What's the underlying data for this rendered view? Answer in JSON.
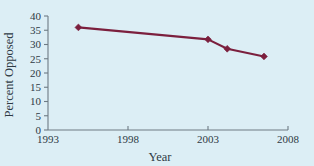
{
  "chart_data": {
    "type": "line",
    "title": "",
    "xlabel": "Year",
    "ylabel": "Percent Opposed",
    "xlim": [
      1993,
      2008
    ],
    "ylim": [
      0,
      40
    ],
    "grid": false,
    "legend": false,
    "xticks": [
      1993,
      1998,
      2003,
      2008
    ],
    "xtick_labels": [
      "1993",
      "1998",
      "2003",
      "2008"
    ],
    "yticks": [
      0,
      5,
      10,
      15,
      20,
      25,
      30,
      35,
      40
    ],
    "ytick_labels": [
      "0",
      "5",
      "10",
      "15",
      "20",
      "25",
      "30",
      "35",
      "40"
    ],
    "series": [
      {
        "name": "Percent Opposed",
        "color": "#7b1f3d",
        "marker": "diamond",
        "x": [
          1994.9,
          2003.0,
          2004.2,
          2006.5
        ],
        "values": [
          36.0,
          31.8,
          28.5,
          25.8
        ]
      }
    ]
  },
  "style": {
    "background_color": "#dceef5",
    "line_color": "#7b1f3d",
    "axis_color": "#6e7b84",
    "text_color": "#2e3a44"
  }
}
